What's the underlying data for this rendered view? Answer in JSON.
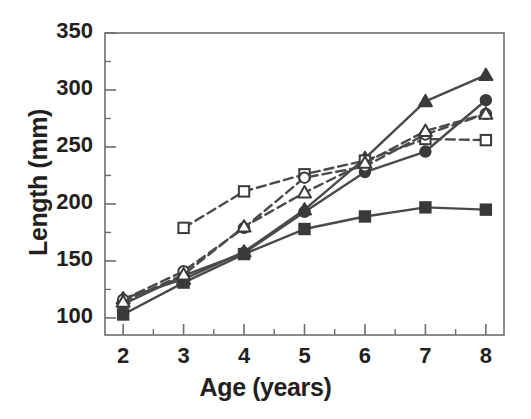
{
  "chart_data": {
    "type": "line",
    "title": "",
    "xlabel": "Age (years)",
    "ylabel": "Length (mm)",
    "x": [
      2,
      3,
      4,
      5,
      6,
      7,
      8
    ],
    "xlim": [
      1.7,
      8.3
    ],
    "ylim": [
      85,
      350
    ],
    "xticks": [
      2,
      3,
      4,
      5,
      6,
      7,
      8
    ],
    "xtick_labels": [
      "2",
      "3",
      "4",
      "5",
      "6",
      "7",
      "8"
    ],
    "xminor_ticks": [
      2.5,
      3.5,
      4.5,
      5.5,
      6.5,
      7.5
    ],
    "yticks": [
      100,
      150,
      200,
      250,
      300,
      350
    ],
    "ytick_labels": [
      "100",
      "150",
      "200",
      "250",
      "300",
      "350"
    ],
    "yminor_ticks": [
      125,
      175,
      225,
      275,
      325
    ],
    "grid": false,
    "legend": "none",
    "frame": "box",
    "marker_color": "#3a3a3c",
    "line_color": "#4a4a4c",
    "axis_color": "#6e6e70",
    "text_color": "#231f20",
    "series": [
      {
        "name": "filled-triangle",
        "marker": "triangle",
        "fill": "solid",
        "linestyle": "solid",
        "x": [
          2,
          3,
          4,
          5,
          6,
          7,
          8
        ],
        "values": [
          117,
          134,
          158,
          195,
          240,
          290,
          313
        ]
      },
      {
        "name": "filled-circle",
        "marker": "circle",
        "fill": "solid",
        "linestyle": "solid",
        "x": [
          2,
          3,
          4,
          5,
          6,
          7,
          8
        ],
        "values": [
          112,
          137,
          157,
          193,
          228,
          246,
          291
        ]
      },
      {
        "name": "filled-square",
        "marker": "square",
        "fill": "solid",
        "linestyle": "solid",
        "x": [
          2,
          3,
          4,
          5,
          6,
          7,
          8
        ],
        "values": [
          103,
          131,
          156,
          178,
          189,
          197,
          195
        ]
      },
      {
        "name": "open-square",
        "marker": "square",
        "fill": "open",
        "linestyle": "dashed",
        "x": [
          3,
          4,
          5,
          6,
          7,
          8
        ],
        "values": [
          179,
          211,
          226,
          238,
          257,
          256
        ]
      },
      {
        "name": "open-circle",
        "marker": "circle",
        "fill": "open",
        "linestyle": "dashed",
        "x": [
          2,
          3,
          4,
          5,
          6,
          7,
          8
        ],
        "values": [
          116,
          141,
          179,
          223,
          233,
          261,
          279
        ]
      },
      {
        "name": "open-triangle",
        "marker": "triangle",
        "fill": "open",
        "linestyle": "dashed",
        "x": [
          2,
          3,
          4,
          5,
          6,
          7,
          8
        ],
        "values": [
          114,
          138,
          180,
          210,
          236,
          264,
          279
        ]
      }
    ]
  },
  "axes": {
    "x_title": "Age (years)",
    "y_title": "Length (mm)"
  }
}
